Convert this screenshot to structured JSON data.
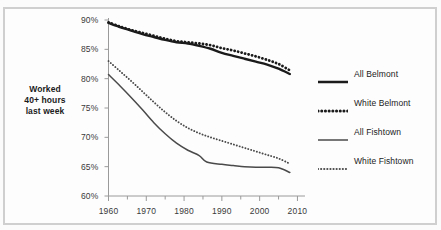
{
  "figure": {
    "cropped_title": "",
    "frame_color": "#cfcfcf",
    "background_color": "#fdfdfd"
  },
  "chart_data": {
    "type": "line",
    "title": "",
    "xlabel": "",
    "ylabel": "Worked 40+ hours last week",
    "ylabel_lines": [
      "Worked",
      "40+ hours",
      "last week"
    ],
    "xlim": [
      1960,
      2012
    ],
    "ylim": [
      60,
      90
    ],
    "grid": false,
    "legend_position": "right",
    "ytick_labels": [
      "90%",
      "85%",
      "80%",
      "75%",
      "70%",
      "65%",
      "60%"
    ],
    "ytick_values": [
      90,
      85,
      80,
      75,
      70,
      65,
      60
    ],
    "xtick_labels": [
      "1960",
      "1970",
      "1980",
      "1990",
      "2000",
      "2010"
    ],
    "xtick_values": [
      1960,
      1970,
      1980,
      1990,
      2000,
      2010
    ],
    "xtick_minor_values": [
      1965,
      1975,
      1985,
      1995,
      2005
    ],
    "series": [
      {
        "name": "All Belmont",
        "style": "solid",
        "width": "thick",
        "color": "#1b1b1b",
        "x": [
          1960,
          1963,
          1966,
          1969,
          1972,
          1975,
          1978,
          1981,
          1984,
          1987,
          1990,
          1993,
          1996,
          1999,
          2002,
          2005,
          2008
        ],
        "values": [
          89.5,
          88.8,
          88.2,
          87.6,
          87.1,
          86.6,
          86.2,
          86.0,
          85.6,
          85.1,
          84.4,
          83.9,
          83.4,
          82.9,
          82.4,
          81.7,
          80.8
        ]
      },
      {
        "name": "White Belmont",
        "style": "dotted",
        "width": "thick",
        "color": "#1b1b1b",
        "x": [
          1960,
          1963,
          1966,
          1969,
          1972,
          1975,
          1978,
          1981,
          1984,
          1987,
          1990,
          1993,
          1996,
          1999,
          2002,
          2005,
          2008
        ],
        "values": [
          89.6,
          88.9,
          88.3,
          87.8,
          87.3,
          86.8,
          86.4,
          86.2,
          86.0,
          85.7,
          85.2,
          84.8,
          84.3,
          83.8,
          83.2,
          82.5,
          81.4
        ]
      },
      {
        "name": "All Fishtown",
        "style": "solid",
        "width": "thin",
        "color": "#4a4a4a",
        "x": [
          1960,
          1963,
          1966,
          1969,
          1972,
          1975,
          1978,
          1981,
          1984,
          1986,
          1990,
          1993,
          1996,
          1999,
          2002,
          2005,
          2008
        ],
        "values": [
          80.7,
          78.8,
          76.8,
          74.7,
          72.5,
          70.6,
          69.0,
          67.8,
          66.9,
          65.8,
          65.4,
          65.2,
          65.0,
          64.9,
          64.9,
          64.8,
          64.0
        ]
      },
      {
        "name": "White Fishtown",
        "style": "dotted",
        "width": "thin",
        "color": "#4a4a4a",
        "x": [
          1960,
          1963,
          1966,
          1969,
          1972,
          1975,
          1978,
          1981,
          1984,
          1987,
          1990,
          1993,
          1996,
          1999,
          2002,
          2005,
          2008
        ],
        "values": [
          83.0,
          81.3,
          79.6,
          77.8,
          76.0,
          74.3,
          72.8,
          71.6,
          70.7,
          70.0,
          69.4,
          68.8,
          68.2,
          67.6,
          67.0,
          66.4,
          65.5
        ]
      }
    ]
  },
  "legend": {
    "items": [
      {
        "label": "All Belmont",
        "style": "solid",
        "width": "thick"
      },
      {
        "label": "White Belmont",
        "style": "dotted",
        "width": "thick"
      },
      {
        "label": "All Fishtown",
        "style": "solid",
        "width": "thin"
      },
      {
        "label": "White Fishtown",
        "style": "dotted",
        "width": "thin"
      }
    ]
  }
}
